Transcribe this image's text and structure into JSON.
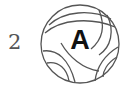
{
  "label": {
    "number": "2"
  },
  "ball": {
    "icon": "volleyball-icon",
    "letter": "A",
    "stroke": "#555555"
  }
}
